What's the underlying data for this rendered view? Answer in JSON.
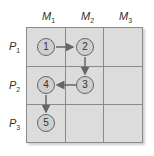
{
  "columns": [
    {
      "label": "M",
      "sub": "1"
    },
    {
      "label": "M",
      "sub": "2"
    },
    {
      "label": "M",
      "sub": "3"
    }
  ],
  "rows": [
    {
      "label": "P",
      "sub": "1"
    },
    {
      "label": "P",
      "sub": "2"
    },
    {
      "label": "P",
      "sub": "3"
    }
  ],
  "nodes": [
    {
      "label": "1",
      "row": 1,
      "col": 1
    },
    {
      "label": "2",
      "row": 1,
      "col": 2
    },
    {
      "label": "3",
      "row": 2,
      "col": 2
    },
    {
      "label": "4",
      "row": 2,
      "col": 1
    },
    {
      "label": "5",
      "row": 3,
      "col": 1
    }
  ],
  "edges": [
    {
      "from": "1",
      "to": "2"
    },
    {
      "from": "2",
      "to": "3"
    },
    {
      "from": "3",
      "to": "4"
    },
    {
      "from": "4",
      "to": "5"
    }
  ],
  "colors": {
    "cell": "#dcdcdc",
    "grid_line": "#8a8a8a",
    "node_fill": "#cfcfcf",
    "arrow": "#666666"
  }
}
